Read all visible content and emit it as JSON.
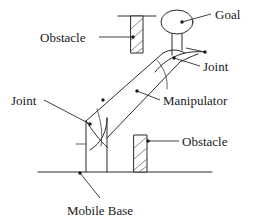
{
  "figure": {
    "background_color": "#ffffff",
    "line_color": "#2b2b2b",
    "width": 260,
    "height": 223
  },
  "labels": {
    "obstacle_top": "Obstacle",
    "goal": "Goal",
    "joint_wrist": "Joint",
    "joint_base": "Joint",
    "manipulator": "Manipulator",
    "obstacle_bottom": "Obstacle",
    "mobile_base": "Mobile Base"
  },
  "parts": {
    "goal_shape": "ellipse",
    "obstacle_top_shape": "hatched-rectangle-hanging",
    "obstacle_bottom_shape": "hatched-rectangle-standing",
    "ground_line": "horizontal-floor",
    "ceiling_line": "horizontal-ceiling",
    "base_shape": "vertical-column",
    "link_shape": "diagonal-link"
  }
}
